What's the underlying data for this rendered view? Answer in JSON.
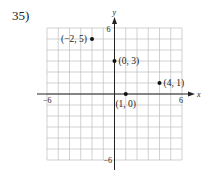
{
  "problem": {
    "number": "35)"
  },
  "chart_data": {
    "type": "scatter",
    "title": "",
    "xlabel": "x",
    "ylabel": "y",
    "xlim": [
      -6,
      6
    ],
    "ylim": [
      -6,
      6
    ],
    "grid": true,
    "tick_labels": {
      "x_min": "−6",
      "x_max": "6",
      "y_min": "−6",
      "y_max": "6"
    },
    "points": [
      {
        "x": -2,
        "y": 5,
        "label": "(−2, 5)"
      },
      {
        "x": 0,
        "y": 3,
        "label": "(0, 3)"
      },
      {
        "x": 4,
        "y": 1,
        "label": "(4, 1)"
      },
      {
        "x": 1,
        "y": 0,
        "label": "(1, 0)"
      }
    ]
  }
}
